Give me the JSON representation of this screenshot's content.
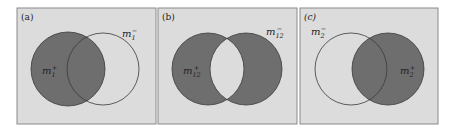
{
  "figure": {
    "colors": {
      "panel_background": "#dcdcdc",
      "panel_border": "#8a8a8a",
      "shaded_fill": "#6e6e6e",
      "circle_stroke": "#3a3a3a"
    },
    "panels": [
      {
        "tag": "(a)",
        "shaded_region": "left circle (A)",
        "inside_label": {
          "base": "m",
          "sub": "1",
          "sup": "+"
        },
        "outside_label": {
          "base": "m",
          "sub": "1",
          "sup": "−"
        }
      },
      {
        "tag": "(b)",
        "shaded_region": "symmetric difference (A xor B)",
        "inside_label": {
          "base": "m",
          "sub": "12",
          "sup": "+"
        },
        "outside_label": {
          "base": "m",
          "sub": "12",
          "sup": "−"
        }
      },
      {
        "tag": "(c)",
        "shaded_region": "right circle (B)",
        "inside_label": {
          "base": "m",
          "sub": "2",
          "sup": "+"
        },
        "outside_label": {
          "base": "m",
          "sub": "2",
          "sup": "−"
        }
      }
    ]
  }
}
